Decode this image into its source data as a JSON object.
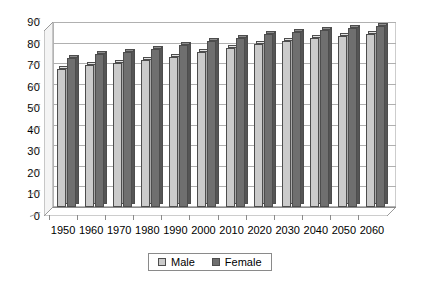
{
  "chart_data": {
    "type": "bar",
    "title": "",
    "xlabel": "",
    "ylabel": "",
    "ylim": [
      0,
      90
    ],
    "ytick_step": 10,
    "yticks": [
      "0",
      "10",
      "20",
      "30",
      "40",
      "50",
      "60",
      "70",
      "80",
      "90"
    ],
    "grid": true,
    "legend_position": "bottom",
    "style": "3d-clustered-column",
    "categories": [
      "1950",
      "1960",
      "1970",
      "1980",
      "1990",
      "2000",
      "2010",
      "2020",
      "2030",
      "2040",
      "2050",
      "2060"
    ],
    "series": [
      {
        "name": "Male",
        "color": "#cbcbcb",
        "values": [
          67,
          69,
          70,
          71.5,
          73,
          75.5,
          77.5,
          79.5,
          81,
          82,
          83,
          84
        ]
      },
      {
        "name": "Female",
        "color": "#6f6f6f",
        "values": [
          72.5,
          74.5,
          75.5,
          77,
          79,
          81,
          82,
          84,
          85,
          86,
          87,
          88
        ]
      }
    ]
  },
  "legend": {
    "items": [
      {
        "label": "Male"
      },
      {
        "label": "Female"
      }
    ]
  },
  "colors": {
    "male_bar": "#cbcbcb",
    "female_bar": "#6f6f6f",
    "gridline": "#b0b0b0",
    "axis": "#8a8a8a",
    "background": "#ffffff"
  }
}
